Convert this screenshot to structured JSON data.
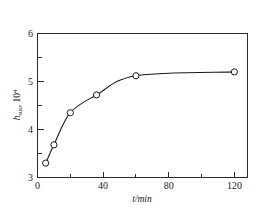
{
  "chart_data": {
    "type": "scatter",
    "title": "",
    "subtitle": "",
    "xlabel": "t/min",
    "ylabel": "h",
    "ylabel_sub": "sus",
    "ylabel_factor": "10",
    "ylabel_exponent": "4",
    "x": [
      5,
      10,
      20,
      36,
      60,
      120
    ],
    "values": [
      3.3,
      3.68,
      4.35,
      4.72,
      5.12,
      5.2
    ],
    "series": [
      {
        "name": "h_sus x 10^4",
        "x": [
          5,
          10,
          20,
          36,
          60,
          120
        ],
        "values": [
          3.3,
          3.68,
          4.35,
          4.72,
          5.12,
          5.2
        ]
      }
    ],
    "xlim": [
      0,
      128
    ],
    "ylim": [
      3,
      6
    ],
    "xticks": [
      0,
      40,
      80,
      120
    ],
    "xticklabels": [
      "0",
      "40",
      "80",
      "120"
    ],
    "yticks": [
      3,
      4,
      5,
      6
    ],
    "yticklabels": [
      "3",
      "4",
      "5",
      "6"
    ],
    "x_minor_ticks": [
      20,
      60,
      100
    ],
    "y_minor_ticks": [
      3.5,
      4.5,
      5.5
    ],
    "grid": false,
    "legend": null,
    "marker_style": "open-circle",
    "line_style": "smooth-solid",
    "colors": {
      "axis": "#2b2b2b",
      "line": "#1a1a1a",
      "marker_fill": "#ffffff",
      "marker_edge": "#1a1a1a",
      "background": "#ffffff",
      "text": "#1a1a1a"
    }
  },
  "figure": {
    "background": "#ffffff"
  }
}
